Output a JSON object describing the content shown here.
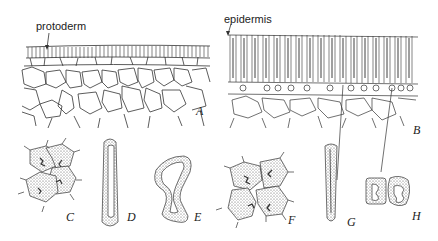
{
  "figure": {
    "panels": [
      {
        "id": "A",
        "letter": "A",
        "description": "protoderm over ground meristem cells"
      },
      {
        "id": "B",
        "letter": "B",
        "description": "epidermis of elongated macrosclereids over parenchyma"
      },
      {
        "id": "C",
        "letter": "C"
      },
      {
        "id": "D",
        "letter": "D"
      },
      {
        "id": "E",
        "letter": "E"
      },
      {
        "id": "F",
        "letter": "F"
      },
      {
        "id": "G",
        "letter": "G"
      },
      {
        "id": "H",
        "letter": "H"
      }
    ],
    "labels": {
      "protoderm": "protoderm",
      "epidermis": "epidermis"
    }
  }
}
